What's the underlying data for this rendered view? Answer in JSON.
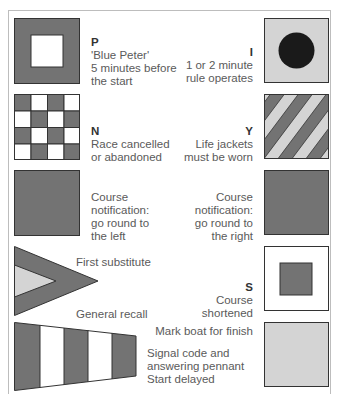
{
  "colors": {
    "dark": "#737373",
    "light": "#d4d4d4",
    "white": "#ffffff",
    "black": "#1a1a1a",
    "outline": "#333333",
    "text": "#5a5a5a"
  },
  "flags": {
    "p": {
      "code": "P",
      "lines": [
        "'Blue Peter'",
        "5 minutes before",
        "the start"
      ],
      "pattern": "dark square with white centre square"
    },
    "i": {
      "code": "I",
      "lines": [
        "1 or 2 minute",
        "rule operates"
      ],
      "pattern": "light square with black disc"
    },
    "n": {
      "code": "N",
      "lines": [
        "Race cancelled",
        "or abandoned"
      ],
      "pattern": "4x4 checkerboard"
    },
    "y": {
      "code": "Y",
      "lines": [
        "Life jackets",
        "must be worn"
      ],
      "pattern": "diagonal stripes"
    },
    "course_left": {
      "code": "",
      "lines": [
        "Course",
        "notification:",
        "go round to",
        "the left"
      ],
      "pattern": "solid dark"
    },
    "course_right": {
      "code": "",
      "lines": [
        "Course",
        "notification:",
        "go round to",
        "the right"
      ],
      "pattern": "solid dark"
    },
    "first_substitute": {
      "lines": [
        "First substitute"
      ],
      "pattern": "triangular pennant"
    },
    "general_recall": {
      "lines": [
        "General recall"
      ]
    },
    "s": {
      "code": "S",
      "lines": [
        "Course",
        "shortened"
      ],
      "pattern": "white square with dark centre square"
    },
    "mark_boat": {
      "lines": [
        "Mark boat for finish"
      ],
      "pattern": "solid light"
    },
    "answering_pennant": {
      "lines": [
        "Signal code and",
        "answering pennant",
        "Start delayed"
      ],
      "pattern": "tapered pennant with vertical stripes"
    }
  }
}
